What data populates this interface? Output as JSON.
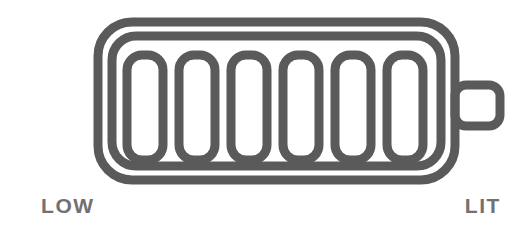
{
  "figure": {
    "name": "battery-charge-gauge",
    "background_color": "#ffffff",
    "stroke_color": "#5a5a5a",
    "label_color": "#717171",
    "stroke_width": 9
  },
  "battery": {
    "icon_name": "battery-icon",
    "outer_shell": {
      "name": "battery-outer-shell",
      "x": 98,
      "y": 22,
      "width": 357,
      "height": 158,
      "radius": 34
    },
    "inner_shell": {
      "name": "battery-inner-shell",
      "x": 112,
      "y": 36,
      "width": 329,
      "height": 130,
      "radius": 24
    },
    "terminal": {
      "name": "battery-terminal-nub",
      "x": 455,
      "y": 85,
      "width": 45,
      "height": 41,
      "radius": 11
    },
    "segments_filled": 6,
    "segments_total": 6,
    "segments": [
      {
        "name": "battery-segment-1",
        "index": 1,
        "x": 127,
        "y": 55,
        "width": 36,
        "height": 105,
        "radius": 15
      },
      {
        "name": "battery-segment-2",
        "index": 2,
        "x": 179,
        "y": 55,
        "width": 36,
        "height": 105,
        "radius": 15
      },
      {
        "name": "battery-segment-3",
        "index": 3,
        "x": 231,
        "y": 55,
        "width": 36,
        "height": 105,
        "radius": 15
      },
      {
        "name": "battery-segment-4",
        "index": 4,
        "x": 283,
        "y": 55,
        "width": 36,
        "height": 105,
        "radius": 15
      },
      {
        "name": "battery-segment-5",
        "index": 5,
        "x": 335,
        "y": 55,
        "width": 36,
        "height": 105,
        "radius": 15
      },
      {
        "name": "battery-segment-6",
        "index": 6,
        "x": 387,
        "y": 55,
        "width": 36,
        "height": 105,
        "radius": 15
      }
    ]
  },
  "labels": {
    "low": "LOW",
    "lit": "LIT"
  }
}
